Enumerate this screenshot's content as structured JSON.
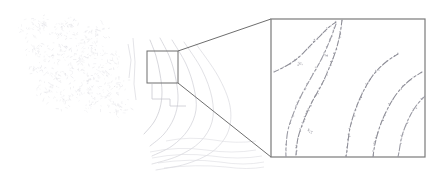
{
  "figure": {
    "caption": "",
    "background_color": "#ffffff",
    "width": 440,
    "height": 174
  },
  "overview_panel": {
    "name": "overview-map",
    "region": {
      "x": 0,
      "y": 0,
      "width": 265,
      "height": 174
    },
    "has_border": false,
    "line_color": "#b9b9c2",
    "faint_line_color": "#d9d9de",
    "description": "Faint grayscale contour / migration aperture map with speckled noise texture on the left and concentric arc contours converging toward the lower centre."
  },
  "roi_box": {
    "name": "roi-selection-box",
    "x": 147,
    "y": 51,
    "width": 31,
    "height": 32,
    "stroke_color": "#6e6e6e",
    "stroke_width": 1,
    "fill": "none",
    "label": ""
  },
  "leader_lines": {
    "name": "zoom-leader-lines",
    "stroke_color": "#6e6e6e",
    "stroke_width": 1,
    "lines": [
      {
        "x1": 178,
        "y1": 51,
        "x2": 271,
        "y2": 19
      },
      {
        "x1": 178,
        "y1": 83,
        "x2": 271,
        "y2": 157
      }
    ]
  },
  "inset_panel": {
    "name": "magnified-inset",
    "x": 271,
    "y": 19,
    "width": 154,
    "height": 138,
    "stroke_color": "#7a7a7a",
    "stroke_width": 1.2,
    "fill": "#ffffff",
    "zoom_factor": "",
    "description": "Magnified view of the selected region showing dashed / speckled curvilinear contour traces; several concentric arcs sweep from the lower-left to the right edge."
  },
  "chart_data": {
    "type": "line",
    "title": "",
    "xlabel": "",
    "ylabel": "",
    "grid": false,
    "legend": "none",
    "xlim": [
      0,
      440
    ],
    "ylim": [
      0,
      174
    ],
    "series": [
      {
        "name": "overview-speckle-cloud",
        "style": "speckle",
        "color": "#dedee3",
        "points": [
          [
            30,
            28
          ],
          [
            44,
            22
          ],
          [
            58,
            33
          ],
          [
            70,
            26
          ],
          [
            86,
            38
          ],
          [
            98,
            30
          ],
          [
            36,
            48
          ],
          [
            52,
            55
          ],
          [
            66,
            46
          ],
          [
            80,
            58
          ],
          [
            94,
            50
          ],
          [
            108,
            60
          ],
          [
            42,
            70
          ],
          [
            56,
            78
          ],
          [
            72,
            68
          ],
          [
            88,
            80
          ],
          [
            102,
            72
          ],
          [
            116,
            84
          ],
          [
            48,
            92
          ],
          [
            64,
            100
          ],
          [
            78,
            90
          ],
          [
            92,
            102
          ],
          [
            106,
            95
          ],
          [
            120,
            106
          ]
        ]
      },
      {
        "name": "overview-arc-1",
        "style": "arc",
        "color": "#c6c6cd",
        "points": [
          [
            150,
            40
          ],
          [
            156,
            56
          ],
          [
            160,
            74
          ],
          [
            162,
            92
          ],
          [
            160,
            108
          ],
          [
            154,
            122
          ],
          [
            144,
            134
          ]
        ]
      },
      {
        "name": "overview-arc-2",
        "style": "arc",
        "color": "#cbcbd2",
        "points": [
          [
            160,
            38
          ],
          [
            170,
            58
          ],
          [
            176,
            80
          ],
          [
            178,
            100
          ],
          [
            174,
            118
          ],
          [
            164,
            134
          ],
          [
            150,
            146
          ]
        ]
      },
      {
        "name": "overview-arc-3",
        "style": "arc",
        "color": "#cfcfd6",
        "points": [
          [
            172,
            40
          ],
          [
            186,
            64
          ],
          [
            194,
            88
          ],
          [
            196,
            110
          ],
          [
            188,
            130
          ],
          [
            172,
            146
          ],
          [
            152,
            156
          ]
        ]
      },
      {
        "name": "overview-arc-4",
        "style": "arc",
        "color": "#d4d4da",
        "points": [
          [
            184,
            42
          ],
          [
            202,
            70
          ],
          [
            212,
            98
          ],
          [
            212,
            122
          ],
          [
            200,
            142
          ],
          [
            178,
            156
          ],
          [
            152,
            164
          ]
        ]
      },
      {
        "name": "overview-arc-5",
        "style": "arc",
        "color": "#d8d8de",
        "points": [
          [
            196,
            44
          ],
          [
            218,
            76
          ],
          [
            230,
            106
          ],
          [
            228,
            132
          ],
          [
            212,
            152
          ],
          [
            186,
            164
          ],
          [
            156,
            170
          ]
        ]
      },
      {
        "name": "inset-trace-1",
        "style": "dashed-speckle",
        "color": "#8e8e98",
        "points": [
          [
            274,
            72
          ],
          [
            286,
            66
          ],
          [
            298,
            58
          ],
          [
            308,
            48
          ],
          [
            318,
            38
          ],
          [
            328,
            28
          ],
          [
            336,
            22
          ]
        ]
      },
      {
        "name": "inset-trace-2",
        "style": "dashed-speckle",
        "color": "#8e8e98",
        "points": [
          [
            342,
            20
          ],
          [
            340,
            34
          ],
          [
            336,
            50
          ],
          [
            330,
            66
          ],
          [
            322,
            84
          ],
          [
            312,
            102
          ],
          [
            304,
            120
          ],
          [
            298,
            138
          ],
          [
            296,
            155
          ]
        ]
      },
      {
        "name": "inset-trace-3",
        "style": "dashed-speckle",
        "color": "#9a9aa4",
        "points": [
          [
            336,
            24
          ],
          [
            330,
            40
          ],
          [
            322,
            58
          ],
          [
            312,
            76
          ],
          [
            302,
            94
          ],
          [
            294,
            112
          ],
          [
            288,
            130
          ],
          [
            286,
            148
          ],
          [
            286,
            157
          ]
        ]
      },
      {
        "name": "inset-arc-a",
        "style": "dashed-speckle",
        "color": "#8e8e98",
        "points": [
          [
            398,
            54
          ],
          [
            386,
            62
          ],
          [
            374,
            74
          ],
          [
            364,
            90
          ],
          [
            356,
            108
          ],
          [
            350,
            128
          ],
          [
            347,
            150
          ],
          [
            346,
            157
          ]
        ]
      },
      {
        "name": "inset-arc-b",
        "style": "dashed-speckle",
        "color": "#8e8e98",
        "points": [
          [
            422,
            72
          ],
          [
            410,
            80
          ],
          [
            398,
            92
          ],
          [
            388,
            108
          ],
          [
            380,
            126
          ],
          [
            375,
            144
          ],
          [
            373,
            157
          ]
        ]
      },
      {
        "name": "inset-arc-c",
        "style": "dashed-speckle",
        "color": "#9a9aa4",
        "points": [
          [
            425,
            96
          ],
          [
            416,
            106
          ],
          [
            408,
            120
          ],
          [
            402,
            136
          ],
          [
            399,
            152
          ],
          [
            398,
            157
          ]
        ]
      }
    ],
    "annotations": [
      {
        "name": "roi-box",
        "x": 147,
        "y": 51,
        "w": 31,
        "h": 32
      },
      {
        "name": "inset-frame",
        "x": 271,
        "y": 19,
        "w": 154,
        "h": 138
      }
    ]
  }
}
